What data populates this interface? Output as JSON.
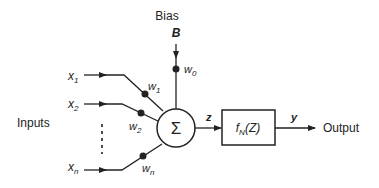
{
  "diagram": {
    "bias": {
      "label": "Bias",
      "symbol": "B",
      "weight": "w",
      "weight_sub": "0"
    },
    "inputs_label": "Inputs",
    "inputs": [
      {
        "x": "x",
        "sub": "1",
        "w": "w",
        "wsub": "1"
      },
      {
        "x": "x",
        "sub": "2",
        "w": "w",
        "wsub": "2"
      },
      {
        "x": "x",
        "sub": "n",
        "w": "w",
        "wsub": "n"
      }
    ],
    "summation_symbol": "Σ",
    "z_label": "z",
    "activation": {
      "f": "f",
      "sub": "N",
      "arg": "(Z)"
    },
    "y_label": "y",
    "output_label": "Output"
  }
}
